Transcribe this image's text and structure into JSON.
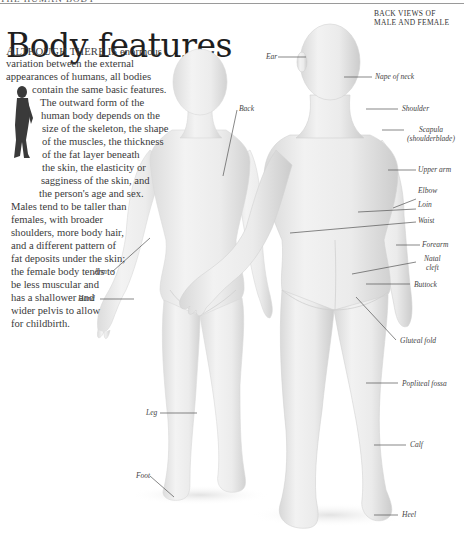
{
  "header": {
    "running_head": "THE HUMAN BODY",
    "title": "Body features",
    "section_label_line1": "BACK VIEWS OF",
    "section_label_line2": "MALE AND FEMALE"
  },
  "intro": {
    "lines": [
      {
        "dropcap": "A",
        "smallcaps": "LTHOUGH THERE IS",
        "rest": " enormous"
      },
      {
        "text": "variation between the external"
      },
      {
        "text": "appearances of humans, all bodies"
      },
      {
        "text": "contain the same basic features."
      },
      {
        "text": "The outward form of the"
      },
      {
        "text": "human body depends on the"
      },
      {
        "text": "size of the skeleton, the shape"
      },
      {
        "text": "of the muscles, the thickness"
      },
      {
        "text": "of the fat layer beneath"
      },
      {
        "text": "the skin, the elasticity or"
      },
      {
        "text": "sagginess of the skin, and"
      },
      {
        "text": "the person's age and sex."
      },
      {
        "text": "Males tend to be taller than"
      },
      {
        "text": "females, with broader"
      },
      {
        "text": "shoulders, more body hair,"
      },
      {
        "text": "and a different pattern of"
      },
      {
        "text": "fat deposits under the skin;"
      },
      {
        "text": "the female body tends to"
      },
      {
        "text": "be less muscular and"
      },
      {
        "text": "has a shallower and"
      },
      {
        "text": "wider pelvis to allow"
      },
      {
        "text": "for childbirth."
      }
    ]
  },
  "mini_figure": {
    "icon": "muscle-figure-icon"
  },
  "labels": {
    "ear": "Ear",
    "nape": "Nape of neck",
    "shoulder": "Shoulder",
    "scapula_1": "Scapula",
    "scapula_2": "(shoulderblade)",
    "back": "Back",
    "upper_arm": "Upper arm",
    "elbow": "Elbow",
    "loin": "Loin",
    "waist": "Waist",
    "forearm": "Forearm",
    "natal_1": "Natal",
    "natal_2": "cleft",
    "buttock": "Buttock",
    "arm": "Arm",
    "hand": "Hand",
    "gluteal": "Gluteal fold",
    "popliteal": "Popliteal fossa",
    "leg": "Leg",
    "calf": "Calf",
    "foot": "Foot",
    "heel": "Heel"
  },
  "colors": {
    "skin_light": "#f4f4f4",
    "skin_mid": "#e6e6e6",
    "skin_shadow": "#cfcfcf",
    "leader_line": "#555555",
    "text": "#3a3a3a"
  }
}
